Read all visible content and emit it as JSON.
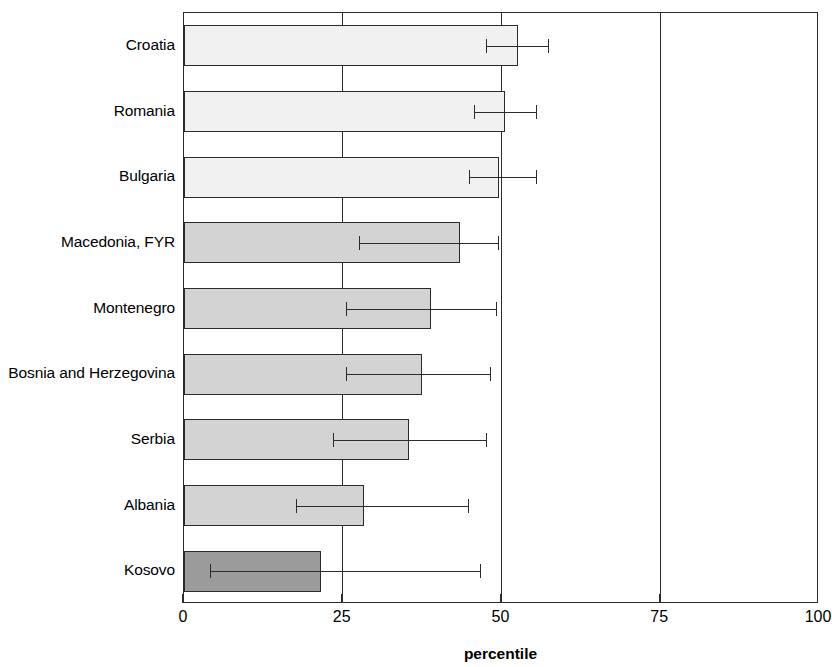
{
  "chart_data": {
    "type": "bar",
    "orientation": "horizontal",
    "title": "",
    "xlabel": "percentile",
    "ylabel": "",
    "xlim": [
      0,
      100
    ],
    "xticks": [
      0,
      25,
      50,
      75,
      100
    ],
    "xtick_labels": [
      "0",
      "25",
      "50",
      "75",
      "100"
    ],
    "grid": "vertical gridlines at 25, 50, 75",
    "legend": "none",
    "categories": [
      "Croatia",
      "Romania",
      "Bulgaria",
      "Macedonia, FYR",
      "Montenegro",
      "Bosnia and Herzegovina",
      "Serbia",
      "Albania",
      "Kosovo"
    ],
    "values": [
      52.6,
      50.6,
      49.6,
      43.5,
      38.9,
      37.5,
      35.4,
      28.3,
      21.6
    ],
    "error_low": [
      47.6,
      45.7,
      44.9,
      27.6,
      25.5,
      25.5,
      23.5,
      17.6,
      4.1
    ],
    "error_high": [
      57.3,
      55.4,
      55.4,
      49.4,
      49.1,
      48.2,
      47.6,
      44.7,
      46.6
    ],
    "shades": [
      "shade-light",
      "shade-light",
      "shade-light",
      "shade-mid",
      "shade-mid",
      "shade-mid",
      "shade-mid",
      "shade-mid",
      "shade-dark"
    ],
    "colors": {
      "bar_light": "#f1f1f1",
      "bar_mid": "#d3d3d3",
      "bar_dark": "#9b9b9b",
      "outline": "#2b2b2b",
      "background": "#ffffff"
    }
  }
}
